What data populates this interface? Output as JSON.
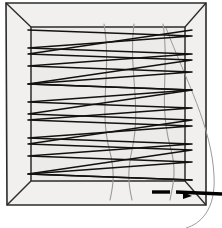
{
  "figure": {
    "background_color": "#ffffff",
    "box_fill_color": "#edebe9",
    "box_edge_color": "#2b2b2b",
    "path_color": "#111111",
    "strand_color": "#9a9a9a",
    "arrow_color": "#000000",
    "width": 222,
    "height": 228
  },
  "outer_box": {
    "label": "outer box front face",
    "corners": [
      [
        6,
        3
      ],
      [
        206,
        3
      ],
      [
        206,
        205
      ],
      [
        7,
        205
      ]
    ]
  },
  "inner_box": {
    "label": "inner box back face",
    "corners": [
      [
        31,
        27
      ],
      [
        185,
        27
      ],
      [
        185,
        181
      ],
      [
        31,
        181
      ]
    ]
  },
  "perspective_edges": {
    "label": "perspective connector edges",
    "segments": [
      [
        [
          6,
          3
        ],
        [
          31,
          27
        ]
      ],
      [
        [
          206,
          3
        ],
        [
          185,
          27
        ]
      ],
      [
        [
          206,
          205
        ],
        [
          185,
          181
        ]
      ],
      [
        [
          7,
          205
        ],
        [
          31,
          181
        ]
      ]
    ]
  },
  "coverage_path": {
    "label": "serpentine coverage path",
    "stroke_width": 1.6,
    "points": [
      [
        28,
        30
      ],
      [
        192,
        36
      ],
      [
        28,
        48
      ],
      [
        192,
        54
      ],
      [
        28,
        66
      ],
      [
        192,
        72
      ],
      [
        28,
        84
      ],
      [
        192,
        90
      ],
      [
        28,
        102
      ],
      [
        192,
        108
      ],
      [
        28,
        120
      ],
      [
        192,
        126
      ],
      [
        28,
        138
      ],
      [
        192,
        144
      ],
      [
        28,
        156
      ],
      [
        192,
        162
      ],
      [
        28,
        174
      ],
      [
        192,
        180
      ]
    ]
  },
  "reverse_path": {
    "label": "return sweep lines",
    "stroke_width": 1.4,
    "points": [
      [
        192,
        30
      ],
      [
        28,
        54
      ],
      [
        192,
        60
      ],
      [
        28,
        84
      ],
      [
        192,
        90
      ],
      [
        28,
        114
      ],
      [
        192,
        120
      ],
      [
        28,
        144
      ],
      [
        192,
        150
      ],
      [
        28,
        174
      ],
      [
        192,
        180
      ]
    ]
  },
  "vertical_strands": {
    "label": "gray vertical strands",
    "color": "#9a9a9a",
    "paths": [
      "M 104 24 C 112 70, 98 110, 110 152 C 116 176, 112 190, 110 200",
      "M 134 24 C 128 68, 142 104, 132 150 C 126 176, 130 190, 132 200",
      "M 163 24 C 170 66, 158 100, 170 146 C 178 172, 172 188, 170 200"
    ]
  },
  "exit_curve": {
    "label": "gray exit curve outside box right",
    "color": "#9a9a9a",
    "path": "M 166 28 C 186 80, 212 128, 214 176 C 216 210, 200 224, 186 228"
  },
  "pointer": {
    "label": "dashed pointer arrow to bottom-right corner",
    "color": "#000000",
    "dashes": [
      {
        "x1": 152,
        "y1": 192,
        "x2": 170,
        "y2": 192
      },
      {
        "x1": 176,
        "y1": 192,
        "x2": 222,
        "y2": 194
      }
    ],
    "arrow_tip": [
      192,
      196
    ]
  },
  "caption": {
    "text": "",
    "visible": false
  }
}
